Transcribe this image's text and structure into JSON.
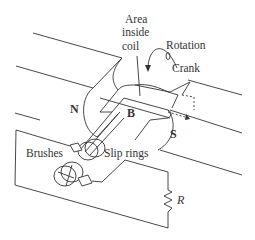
{
  "diagram": {
    "labels": {
      "area_line1": "Area",
      "area_line2": "inside",
      "area_line3": "coil",
      "rotation": "Rotation",
      "crank": "Crank",
      "north": "N",
      "south": "S",
      "field": "B",
      "brushes": "Brushes",
      "slip_rings": "Slip rings",
      "resistor": "R"
    },
    "colors": {
      "line": "#333333",
      "background": "#ffffff"
    }
  }
}
